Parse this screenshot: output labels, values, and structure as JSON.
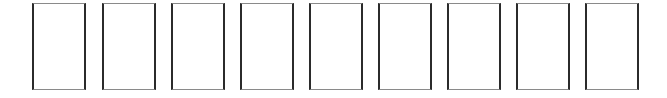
{
  "scene": {
    "background": "#ffffff",
    "border_color_sides": "#2b2b2b",
    "border_color_top_bottom": "#8a8a8a"
  },
  "slots": [
    {
      "index": 1,
      "x": 32,
      "label": ""
    },
    {
      "index": 2,
      "x": 102,
      "label": ""
    },
    {
      "index": 3,
      "x": 171,
      "label": ""
    },
    {
      "index": 4,
      "x": 240,
      "label": ""
    },
    {
      "index": 5,
      "x": 309,
      "label": ""
    },
    {
      "index": 6,
      "x": 378,
      "label": ""
    },
    {
      "index": 7,
      "x": 447,
      "label": ""
    },
    {
      "index": 8,
      "x": 516,
      "label": ""
    },
    {
      "index": 9,
      "x": 585,
      "label": ""
    }
  ]
}
